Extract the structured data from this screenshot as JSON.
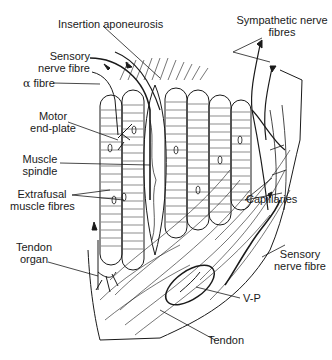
{
  "diagram": {
    "labels": {
      "insertion_aponeurosis": "Insertion aponeurosis",
      "sympathetic_line1": "Sympathetic nerve",
      "sympathetic_line2": "fibres",
      "sensory_top_line1": "Sensory",
      "sensory_top_line2": "nerve fibre",
      "alpha_symbol": "α",
      "alpha_text": " fibre",
      "motor_line1": "Motor",
      "motor_line2": "end-plate",
      "spindle_line1": "Muscle",
      "spindle_line2": "spindle",
      "extrafusal_line1": "Extrafusal",
      "extrafusal_line2": "muscle fibres",
      "capillaries": "Capillaries",
      "sensory_bottom_line1": "Sensory",
      "sensory_bottom_line2": "nerve fibre",
      "tendon_organ_line1": "Tendon",
      "tendon_organ_line2": "organ",
      "vp": "V-P",
      "tendon": "Tendon"
    },
    "colors": {
      "ink": "#1a1a1a",
      "background": "#ffffff"
    }
  }
}
